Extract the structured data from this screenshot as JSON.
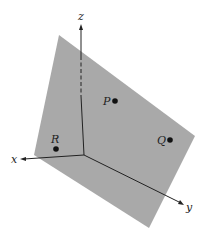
{
  "diagram": {
    "colors": {
      "plane": "#a9a9a9",
      "axis": "#222222",
      "point": "#111111",
      "background": "#ffffff"
    },
    "axes": {
      "z": {
        "label": "z"
      },
      "x": {
        "label": "x"
      },
      "y": {
        "label": "y"
      }
    },
    "points": [
      {
        "label": "P"
      },
      {
        "label": "Q"
      },
      {
        "label": "R"
      }
    ]
  }
}
